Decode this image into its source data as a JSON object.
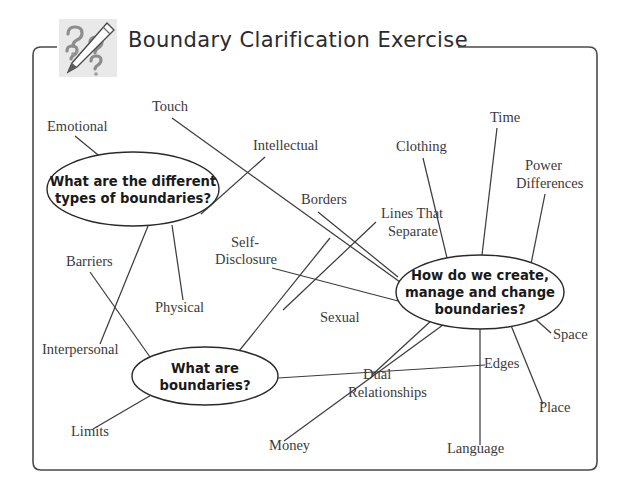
{
  "document": {
    "title": "Boundary Clarification Exercise",
    "icon": "pencil-question-marks-icon",
    "frame_color": "#4a4a4a",
    "background_color": "#ffffff",
    "line_color": "#3d3d3d"
  },
  "mindmap": {
    "nodes": [
      {
        "id": "types",
        "lines": [
          "What are the different",
          "types of boundaries?"
        ],
        "cx": 133,
        "cy": 189,
        "rx": 86,
        "ry": 37
      },
      {
        "id": "what",
        "lines": [
          "What are",
          "boundaries?"
        ],
        "cx": 205,
        "cy": 376,
        "rx": 73,
        "ry": 29
      },
      {
        "id": "create",
        "lines": [
          "How do we create,",
          "manage and change",
          "boundaries?"
        ],
        "cx": 480,
        "cy": 292,
        "rx": 84,
        "ry": 37
      }
    ],
    "leaves": [
      {
        "id": "emotional",
        "label": "Emotional",
        "tx": 47,
        "ty": 131,
        "anchor": "start"
      },
      {
        "id": "touch",
        "label": "Touch",
        "tx": 152,
        "ty": 111,
        "anchor": "start"
      },
      {
        "id": "intellectual",
        "label": "Intellectual",
        "tx": 253,
        "ty": 150,
        "anchor": "start"
      },
      {
        "id": "borders",
        "label": "Borders",
        "tx": 301,
        "ty": 204,
        "anchor": "start"
      },
      {
        "id": "selfdisc1",
        "label": "Self-",
        "tx": 231,
        "ty": 247,
        "anchor": "start"
      },
      {
        "id": "selfdisc2",
        "label": "Disclosure",
        "tx": 215,
        "ty": 264,
        "anchor": "start"
      },
      {
        "id": "barriers",
        "label": "Barriers",
        "tx": 66,
        "ty": 266,
        "anchor": "start"
      },
      {
        "id": "physical",
        "label": "Physical",
        "tx": 155,
        "ty": 312,
        "anchor": "start"
      },
      {
        "id": "interperson",
        "label": "Interpersonal",
        "tx": 42,
        "ty": 354,
        "anchor": "start"
      },
      {
        "id": "limits",
        "label": "Limits",
        "tx": 71,
        "ty": 436,
        "anchor": "start"
      },
      {
        "id": "sexual",
        "label": "Sexual",
        "tx": 320,
        "ty": 322,
        "anchor": "start"
      },
      {
        "id": "money",
        "label": "Money",
        "tx": 269,
        "ty": 450,
        "anchor": "start"
      },
      {
        "id": "dual1",
        "label": "Dual",
        "tx": 363,
        "ty": 379,
        "anchor": "start"
      },
      {
        "id": "dual2",
        "label": "Relationships",
        "tx": 348,
        "ty": 397,
        "anchor": "start"
      },
      {
        "id": "linesthat1",
        "label": "Lines That",
        "tx": 381,
        "ty": 218,
        "anchor": "start"
      },
      {
        "id": "linesthat2",
        "label": "Separate",
        "tx": 388,
        "ty": 236,
        "anchor": "start"
      },
      {
        "id": "clothing",
        "label": "Clothing",
        "tx": 396,
        "ty": 151,
        "anchor": "start"
      },
      {
        "id": "time",
        "label": "Time",
        "tx": 490,
        "ty": 122,
        "anchor": "start"
      },
      {
        "id": "power1",
        "label": "Power",
        "tx": 525,
        "ty": 170,
        "anchor": "start"
      },
      {
        "id": "power2",
        "label": "Differences",
        "tx": 516,
        "ty": 188,
        "anchor": "start"
      },
      {
        "id": "space",
        "label": "Space",
        "tx": 553,
        "ty": 339,
        "anchor": "start"
      },
      {
        "id": "edges",
        "label": "Edges",
        "tx": 484,
        "ty": 368,
        "anchor": "start"
      },
      {
        "id": "place",
        "label": "Place",
        "tx": 539,
        "ty": 412,
        "anchor": "start"
      },
      {
        "id": "language",
        "label": "Language",
        "tx": 447,
        "ty": 453,
        "anchor": "start"
      }
    ],
    "edges": [
      {
        "from": "emotional",
        "to": "types",
        "x1": 75,
        "y1": 136,
        "x2": 103,
        "y2": 159
      },
      {
        "from": "touch",
        "to": "create",
        "x1": 172,
        "y1": 118,
        "x2": 400,
        "y2": 282
      },
      {
        "from": "intellectual",
        "to": "types",
        "x1": 265,
        "y1": 157,
        "x2": 201,
        "y2": 214
      },
      {
        "from": "borders",
        "to": "create",
        "x1": 318,
        "y1": 212,
        "x2": 398,
        "y2": 277
      },
      {
        "from": "selfdisclosure",
        "to": "create",
        "x1": 272,
        "y1": 268,
        "x2": 402,
        "y2": 302
      },
      {
        "from": "barriers",
        "to": "what",
        "x1": 90,
        "y1": 272,
        "x2": 150,
        "y2": 357
      },
      {
        "from": "types",
        "to": "interpersonal",
        "x1": 148,
        "y1": 226,
        "x2": 100,
        "y2": 344
      },
      {
        "from": "types",
        "to": "physical",
        "x1": 172,
        "y1": 225,
        "x2": 183,
        "y2": 300
      },
      {
        "from": "limits",
        "to": "what",
        "x1": 93,
        "y1": 429,
        "x2": 153,
        "y2": 394
      },
      {
        "from": "what",
        "to": "sexual",
        "x1": 239,
        "y1": 351,
        "x2": 330,
        "y2": 238
      },
      {
        "from": "what",
        "to": "create",
        "x1": 278,
        "y1": 378,
        "x2": 485,
        "y2": 365
      },
      {
        "from": "money",
        "to": "create",
        "x1": 284,
        "y1": 441,
        "x2": 447,
        "y2": 322
      },
      {
        "from": "dual",
        "to": "create",
        "x1": 372,
        "y1": 375,
        "x2": 432,
        "y2": 320
      },
      {
        "from": "linesthat",
        "to": "create",
        "x1": 376,
        "y1": 222,
        "x2": 283,
        "y2": 310
      },
      {
        "from": "clothing",
        "to": "create",
        "x1": 423,
        "y1": 158,
        "x2": 447,
        "y2": 258
      },
      {
        "from": "time",
        "to": "create",
        "x1": 497,
        "y1": 128,
        "x2": 482,
        "y2": 255
      },
      {
        "from": "power",
        "to": "create",
        "x1": 545,
        "y1": 194,
        "x2": 531,
        "y2": 264
      },
      {
        "from": "space",
        "to": "create",
        "x1": 551,
        "y1": 333,
        "x2": 533,
        "y2": 317
      },
      {
        "from": "place",
        "to": "create",
        "x1": 543,
        "y1": 404,
        "x2": 510,
        "y2": 323
      },
      {
        "from": "language",
        "to": "create",
        "x1": 480,
        "y1": 445,
        "x2": 480,
        "y2": 329
      }
    ]
  }
}
